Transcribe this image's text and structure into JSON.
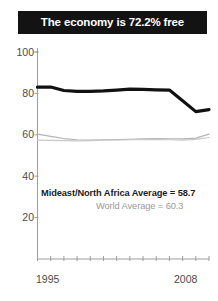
{
  "title": {
    "text": "The economy is 72.2% free",
    "background_color": "#131313",
    "text_color": "#ffffff"
  },
  "annotations": {
    "mideast": {
      "text": "Mideast/North Africa Average = 58.7",
      "color": "#1d1d1d"
    },
    "world": {
      "text": "World Average = 60.3",
      "color": "#9a9a9a"
    }
  },
  "axis": {
    "y_ticks": [
      "100",
      "80",
      "60",
      "40",
      "20"
    ],
    "x_start_label": "1995",
    "x_end_label": "2008"
  },
  "chart_data": {
    "type": "line",
    "title": "The economy is 72.2% free",
    "xlabel": "",
    "ylabel": "",
    "xlim": [
      1995,
      2008
    ],
    "ylim": [
      0,
      100
    ],
    "ytick_values": [
      20,
      40,
      60,
      80,
      100
    ],
    "xtick_values": [
      1995,
      1996,
      1997,
      1998,
      1999,
      2000,
      2001,
      2002,
      2003,
      2004,
      2005,
      2006,
      2007,
      2008
    ],
    "xtick_labels_shown": [
      "1995",
      "2008"
    ],
    "grid": false,
    "legend": "none",
    "x": [
      1995,
      1996,
      1997,
      1998,
      1999,
      2000,
      2001,
      2002,
      2003,
      2004,
      2005,
      2006,
      2007,
      2008
    ],
    "series": [
      {
        "name": "Country economic freedom score",
        "color": "#111111",
        "linewidth": 3.2,
        "values": [
          83.0,
          83.1,
          81.4,
          81.0,
          81.0,
          81.2,
          81.6,
          82.1,
          81.9,
          81.7,
          81.6,
          76.5,
          71.2,
          72.2
        ]
      },
      {
        "name": "World Average",
        "color": "#b4b4b4",
        "linewidth": 1.2,
        "values": [
          60.3,
          59.2,
          58.2,
          57.6,
          57.4,
          57.6,
          57.7,
          57.8,
          58.0,
          58.2,
          58.1,
          58.0,
          58.4,
          60.3
        ]
      },
      {
        "name": "Mideast/North Africa Average",
        "color": "#c8c8c8",
        "linewidth": 1.2,
        "values": [
          57.4,
          57.3,
          57.2,
          57.1,
          57.2,
          57.4,
          57.5,
          57.6,
          57.7,
          57.8,
          57.6,
          57.4,
          57.8,
          58.7
        ]
      }
    ],
    "annotations": [
      "Mideast/North Africa Average = 58.7",
      "World Average = 60.3"
    ]
  }
}
